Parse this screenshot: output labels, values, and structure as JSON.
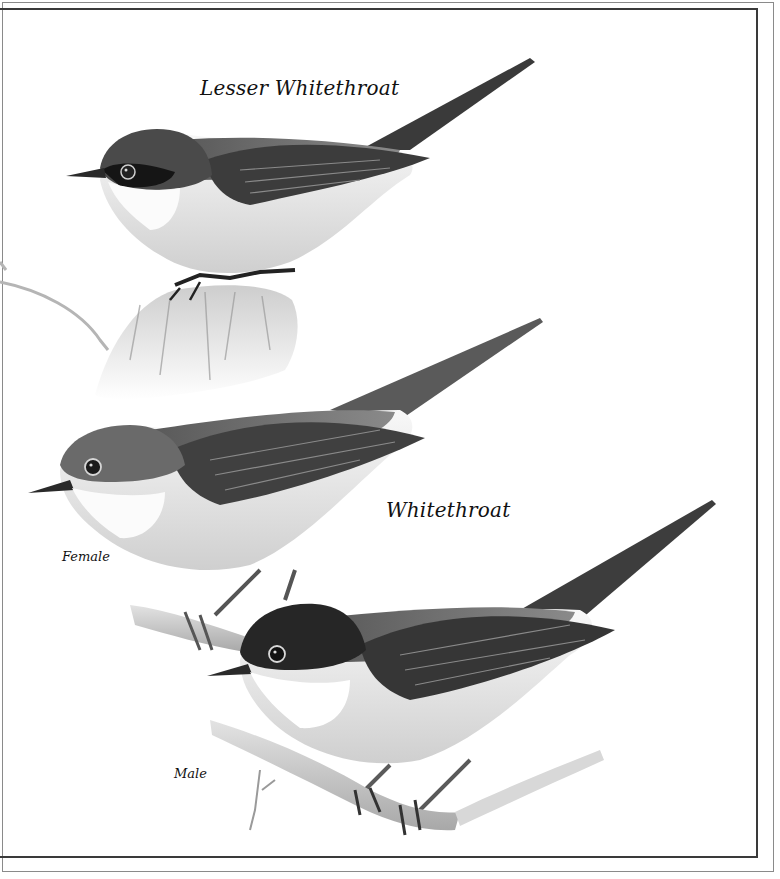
{
  "plate": {
    "style": "grayscale watercolour bird illustration",
    "background_color": "#ffffff",
    "frame": {
      "outer_line_color": "#8a8a8a",
      "inner_line_color": "#3a3a3a"
    }
  },
  "captions": {
    "lesser_whitethroat": "Lesser Whitethroat",
    "whitethroat": "Whitethroat",
    "female": "Female",
    "male": "Male"
  },
  "subjects": [
    {
      "species": "Lesser Whitethroat",
      "sex": "",
      "perch": "mossy stump"
    },
    {
      "species": "Whitethroat",
      "sex": "Female",
      "perch": "branch"
    },
    {
      "species": "Whitethroat",
      "sex": "Male",
      "perch": "branch"
    }
  ],
  "colors": {
    "cap_dark": "#2b2b2b",
    "mantle_gray": "#6e6e6e",
    "wing_dark": "#3c3c3c",
    "underparts": "#e6e6e6",
    "throat_white": "#fbfbfb",
    "branch": "#c9c9c9",
    "branch_shade": "#a9a9a9"
  }
}
